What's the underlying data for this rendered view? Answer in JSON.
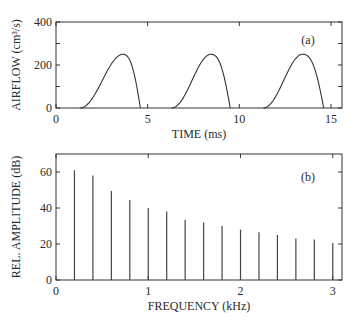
{
  "chart_data": [
    {
      "type": "line",
      "panel_label": "(a)",
      "title": "",
      "xlabel": "TIME (ms)",
      "ylabel": "AIRFLOW (cm³/s)",
      "xlim": [
        0,
        15.6
      ],
      "ylim": [
        0,
        400
      ],
      "xticks": [
        0,
        5,
        10,
        15
      ],
      "yticks": [
        0,
        200,
        400
      ],
      "yticks_minor": [
        100,
        300
      ],
      "grid": false,
      "series": [
        {
          "name": "glottal airflow",
          "pulses": [
            {
              "start": 1.3,
              "peak_time": 3.6,
              "peak": 250,
              "end": 4.6
            },
            {
              "start": 6.3,
              "peak_time": 8.4,
              "peak": 250,
              "end": 9.5
            },
            {
              "start": 11.3,
              "peak_time": 13.4,
              "peak": 250,
              "end": 14.6
            }
          ]
        }
      ]
    },
    {
      "type": "bar",
      "style": "stem",
      "panel_label": "(b)",
      "title": "",
      "xlabel": "FREQUENCY (kHz)",
      "ylabel": "REL. AMPLITUDE (dB)",
      "xlim": [
        0,
        3.1
      ],
      "ylim": [
        0,
        70
      ],
      "xticks": [
        0,
        1,
        2,
        3
      ],
      "yticks": [
        0,
        20,
        40,
        60
      ],
      "grid": false,
      "x": [
        0.2,
        0.4,
        0.6,
        0.8,
        1.0,
        1.2,
        1.4,
        1.6,
        1.8,
        2.0,
        2.2,
        2.4,
        2.6,
        2.8,
        3.0
      ],
      "values": [
        61,
        58,
        49.5,
        44.5,
        40,
        38,
        33.5,
        32,
        30,
        28,
        26.5,
        25,
        23,
        22.5,
        20.5
      ]
    }
  ],
  "labels": {
    "a_panel": "(a)",
    "b_panel": "(b)",
    "a_xlabel": "TIME (ms)",
    "a_ylabel": "AIRFLOW (cm³/s)",
    "b_xlabel": "FREQUENCY (kHz)",
    "b_ylabel": "REL. AMPLITUDE (dB)"
  }
}
